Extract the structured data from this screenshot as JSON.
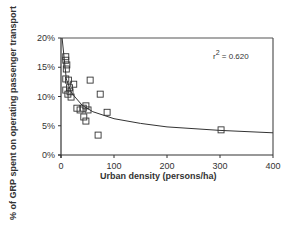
{
  "chart_data": {
    "type": "scatter",
    "title": "",
    "xlabel": "Urban density (persons/ha)",
    "ylabel": "% of GRP spent on operating passenger transport",
    "xlim": [
      0,
      400
    ],
    "ylim": [
      0,
      20
    ],
    "x_ticks": [
      "0",
      "100",
      "200",
      "300",
      "400"
    ],
    "y_ticks": [
      "0%",
      "5%",
      "10%",
      "15%",
      "20%"
    ],
    "grid": false,
    "legend": null,
    "annotation": {
      "text_prefix": "r",
      "text_sup": "2",
      "text_suffix": " = 0.620"
    },
    "series": [
      {
        "name": "Cities",
        "marker": "open-square",
        "points": [
          {
            "x": 9,
            "y": 16.8
          },
          {
            "x": 9,
            "y": 16.2
          },
          {
            "x": 11,
            "y": 15.4
          },
          {
            "x": 10,
            "y": 14.7
          },
          {
            "x": 9,
            "y": 13.0
          },
          {
            "x": 14,
            "y": 12.8
          },
          {
            "x": 24,
            "y": 12.1
          },
          {
            "x": 55,
            "y": 12.8
          },
          {
            "x": 9,
            "y": 11.1
          },
          {
            "x": 16,
            "y": 11.5
          },
          {
            "x": 13,
            "y": 10.4
          },
          {
            "x": 19,
            "y": 9.9
          },
          {
            "x": 17,
            "y": 10.8
          },
          {
            "x": 74,
            "y": 10.4
          },
          {
            "x": 30,
            "y": 8.0
          },
          {
            "x": 42,
            "y": 8.0
          },
          {
            "x": 47,
            "y": 8.4
          },
          {
            "x": 36,
            "y": 7.7
          },
          {
            "x": 51,
            "y": 7.7
          },
          {
            "x": 87,
            "y": 7.3
          },
          {
            "x": 43,
            "y": 6.5
          },
          {
            "x": 47,
            "y": 5.8
          },
          {
            "x": 70,
            "y": 3.4
          },
          {
            "x": 302,
            "y": 4.3
          }
        ]
      },
      {
        "name": "Fitted curve",
        "type": "line",
        "points": [
          {
            "x": 2,
            "y": 20.0
          },
          {
            "x": 10,
            "y": 13.0
          },
          {
            "x": 20,
            "y": 10.6
          },
          {
            "x": 40,
            "y": 8.5
          },
          {
            "x": 60,
            "y": 7.4
          },
          {
            "x": 100,
            "y": 6.2
          },
          {
            "x": 150,
            "y": 5.4
          },
          {
            "x": 200,
            "y": 4.8
          },
          {
            "x": 300,
            "y": 4.2
          },
          {
            "x": 400,
            "y": 3.8
          }
        ]
      }
    ]
  }
}
